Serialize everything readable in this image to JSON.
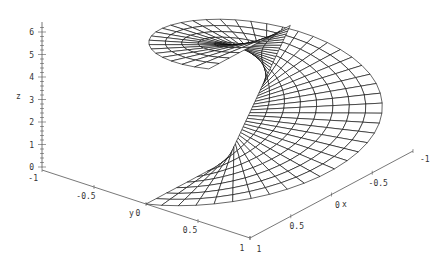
{
  "chart_data": {
    "type": "surface3d",
    "title": "",
    "parametric": {
      "x": "u*cos(v)",
      "y": "u*sin(v)",
      "z": "v",
      "u_range": [
        0,
        1
      ],
      "v_range": [
        0,
        6.283
      ],
      "u_steps": 8,
      "v_steps": 48
    },
    "axes": {
      "x": {
        "label": "x",
        "ticks": [
          "1",
          "0.5",
          "0",
          "-0.5",
          "-1"
        ],
        "range": [
          -1,
          1
        ]
      },
      "y": {
        "label": "y",
        "ticks": [
          "-1",
          "-0.5",
          "0",
          "0.5",
          "1"
        ],
        "range": [
          -1,
          1
        ]
      },
      "z": {
        "label": "z",
        "ticks": [
          "0",
          "1",
          "2",
          "3",
          "4",
          "5",
          "6"
        ],
        "range": [
          0,
          6.283
        ]
      }
    },
    "grid": false,
    "legend": null,
    "mesh_color": "#000000",
    "axis_color": "#555555",
    "background": "#ffffff"
  },
  "projection": {
    "corner": [
      42,
      170
    ],
    "ex": [
      -81.5,
      43.5
    ],
    "ey": [
      104,
      34
    ],
    "ez": [
      10,
      -21.5
    ]
  }
}
